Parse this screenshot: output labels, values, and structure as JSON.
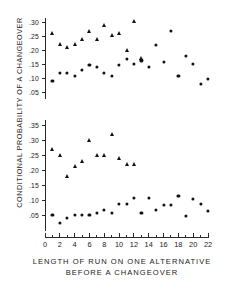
{
  "figure": {
    "axis_title_y": "CONDITIONAL PROBABILITY OF A CHANGEOVER",
    "axis_title_x_line1": "LENGTH OF RUN ON ONE ALTERNATIVE",
    "axis_title_x_line2": "BEFORE A CHANGEOVER",
    "marker_color": "#111111",
    "axis_color": "#2a2a2a",
    "background": "#ffffff"
  },
  "chart_data": [
    {
      "type": "scatter",
      "panel": "upper",
      "title": "",
      "xlabel": "LENGTH OF RUN ON ONE ALTERNATIVE BEFORE A CHANGEOVER",
      "ylabel": "CONDITIONAL PROBABILITY OF A CHANGEOVER",
      "xlim": [
        0,
        22
      ],
      "ylim": [
        0.02,
        0.315
      ],
      "xticks": [
        0,
        2,
        4,
        6,
        8,
        10,
        12,
        14,
        16,
        18,
        20,
        22
      ],
      "xticklabels": [
        "0",
        "2",
        "4",
        "6",
        "8",
        "10",
        "12",
        "14",
        "16",
        "18",
        "20",
        "22"
      ],
      "xticks_minor": [
        1,
        3,
        5,
        7,
        9,
        11,
        13,
        15,
        17,
        19,
        21
      ],
      "yticks": [
        0.05,
        0.1,
        0.15,
        0.2,
        0.25,
        0.3
      ],
      "yticklabels": [
        ".05",
        ".10",
        ".15",
        ".20",
        ".25",
        ".30"
      ],
      "grid": false,
      "legend": "none",
      "series": [
        {
          "name": "triangles-upper",
          "marker": "triangle",
          "points": [
            [
              1,
              0.26
            ],
            [
              2,
              0.222
            ],
            [
              3,
              0.211
            ],
            [
              4,
              0.222
            ],
            [
              5,
              0.239
            ],
            [
              6,
              0.268
            ],
            [
              7,
              0.239
            ],
            [
              8,
              0.289
            ],
            [
              9,
              0.252
            ],
            [
              10,
              0.259
            ],
            [
              11,
              0.2
            ],
            [
              12,
              0.304
            ],
            [
              13,
              0.172
            ]
          ]
        },
        {
          "name": "circles-upper",
          "marker": "circle",
          "points": [
            [
              1,
              0.089
            ],
            [
              2,
              0.119
            ],
            [
              3,
              0.119
            ],
            [
              4,
              0.108
            ],
            [
              5,
              0.129
            ],
            [
              6,
              0.148
            ],
            [
              7,
              0.139
            ],
            [
              8,
              0.119
            ],
            [
              9,
              0.107
            ],
            [
              10,
              0.148
            ],
            [
              11,
              0.168
            ],
            [
              12,
              0.15
            ],
            [
              13,
              0.163
            ],
            [
              14,
              0.139
            ],
            [
              15,
              0.217
            ],
            [
              16,
              0.157
            ],
            [
              17,
              0.267
            ],
            [
              18,
              0.107
            ],
            [
              19,
              0.178
            ],
            [
              20,
              0.149
            ],
            [
              21,
              0.078
            ],
            [
              22,
              0.097
            ]
          ]
        }
      ]
    },
    {
      "type": "scatter",
      "panel": "lower",
      "title": "",
      "xlabel": "LENGTH OF RUN ON ONE ALTERNATIVE BEFORE A CHANGEOVER",
      "ylabel": "CONDITIONAL PROBABILITY OF A CHANGEOVER",
      "xlim": [
        0,
        22
      ],
      "ylim": [
        0.01,
        0.365
      ],
      "xticks": [
        0,
        2,
        4,
        6,
        8,
        10,
        12,
        14,
        16,
        18,
        20,
        22
      ],
      "xticklabels": [
        "0",
        "2",
        "4",
        "6",
        "8",
        "10",
        "12",
        "14",
        "16",
        "18",
        "20",
        "22"
      ],
      "xticks_minor": [
        1,
        3,
        5,
        7,
        9,
        11,
        13,
        15,
        17,
        19,
        21
      ],
      "yticks": [
        0.05,
        0.1,
        0.15,
        0.2,
        0.25,
        0.3,
        0.35
      ],
      "yticklabels": [
        ".05",
        ".10",
        ".15",
        ".20",
        ".25",
        ".30",
        ".35"
      ],
      "grid": false,
      "legend": "none",
      "series": [
        {
          "name": "triangles-lower",
          "marker": "triangle",
          "points": [
            [
              1,
              0.27
            ],
            [
              2,
              0.25
            ],
            [
              3,
              0.181
            ],
            [
              4,
              0.212
            ],
            [
              5,
              0.229
            ],
            [
              6,
              0.3
            ],
            [
              7,
              0.249
            ],
            [
              8,
              0.249
            ],
            [
              9,
              0.32
            ],
            [
              10,
              0.241
            ],
            [
              11,
              0.22
            ],
            [
              12,
              0.22
            ]
          ]
        },
        {
          "name": "circles-lower",
          "marker": "circle",
          "points": [
            [
              1,
              0.05
            ],
            [
              2,
              0.023
            ],
            [
              3,
              0.041
            ],
            [
              4,
              0.05
            ],
            [
              5,
              0.05
            ],
            [
              6,
              0.049
            ],
            [
              7,
              0.058
            ],
            [
              8,
              0.067
            ],
            [
              9,
              0.058
            ],
            [
              10,
              0.088
            ],
            [
              11,
              0.088
            ],
            [
              12,
              0.108
            ],
            [
              13,
              0.058
            ],
            [
              14,
              0.106
            ],
            [
              15,
              0.066
            ],
            [
              16,
              0.084
            ],
            [
              17,
              0.085
            ],
            [
              18,
              0.114
            ],
            [
              19,
              0.048
            ],
            [
              20,
              0.104
            ],
            [
              21,
              0.086
            ],
            [
              22,
              0.065
            ]
          ]
        }
      ]
    }
  ]
}
